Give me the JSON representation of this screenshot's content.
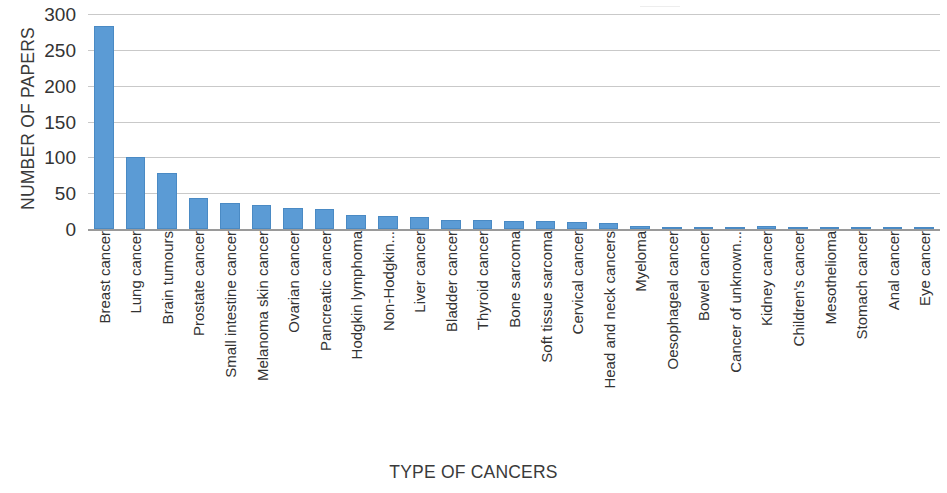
{
  "chart_data": {
    "type": "bar",
    "title": "",
    "xlabel": "TYPE OF CANCERS",
    "ylabel": "NUMBER OF PAPERS",
    "ylim": [
      0,
      300
    ],
    "yticks": [
      0,
      50,
      100,
      150,
      200,
      250,
      300
    ],
    "ytick_labels": [
      "0",
      "50",
      "100",
      "150",
      "200",
      "250",
      "300"
    ],
    "grid": true,
    "legend": "none",
    "series_color": "#5b9bd5",
    "categories": [
      "Breast cancer",
      "Lung cancer",
      "Brain tumours",
      "Prostate cancer",
      "Small intestine cancer",
      "Melanoma skin cancer",
      "Ovarian cancer",
      "Pancreatic cancer",
      "Hodgkin lymphoma",
      "Non-Hodgkin...",
      "Liver cancer",
      "Bladder cancer",
      "Thyroid cancer",
      "Bone sarcoma",
      "Soft tissue sarcoma",
      "Cervical cancer",
      "Head and neck cancers",
      "Myeloma",
      "Oesophageal cancer",
      "Bowel cancer",
      "Cancer of unknown...",
      "Kidney cancer",
      "Children's cancer",
      "Mesothelioma",
      "Stomach cancer",
      "Anal cancer",
      "Eye cancer"
    ],
    "values": [
      283,
      100,
      78,
      43,
      36,
      34,
      30,
      28,
      20,
      18,
      17,
      12,
      12,
      11,
      11,
      10,
      9,
      4,
      3,
      3,
      3,
      4,
      1,
      1,
      1,
      1,
      1
    ]
  }
}
